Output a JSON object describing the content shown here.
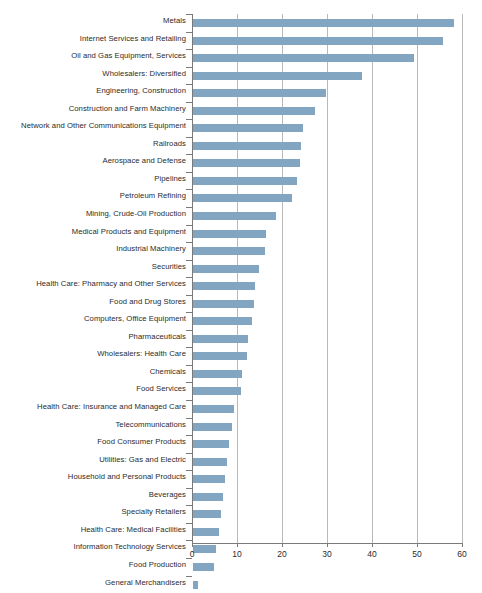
{
  "chart_data": {
    "type": "bar",
    "orientation": "horizontal",
    "title": "",
    "subtitle": "",
    "xlabel": "",
    "ylabel": "",
    "xlim": [
      0,
      60
    ],
    "xticks": [
      0,
      10,
      20,
      30,
      40,
      50,
      60
    ],
    "xtick_labels": [
      "0",
      "10",
      "20",
      "30",
      "40",
      "50",
      "60"
    ],
    "grid": "vertical",
    "legend": "none",
    "bar_color": "#82a6c1",
    "axis_color": "#7a7a7a",
    "gridline_color": "#b9b9b9",
    "text_color": "#2b2b2b",
    "categories": [
      "Metals",
      "Internet Services and Retailing",
      "Oil and Gas Equipment, Services",
      "Wholesalers: Diversified",
      "Engineering, Construction",
      "Construction and Farm Machinery",
      "Network and Other Communications Equipment",
      "Railroads",
      "Aerospace and Defense",
      "Pipelines",
      "Petroleum Refining",
      "Mining, Crude-Oil Production",
      "Medical Products and Equipment",
      "Industrial Machinery",
      "Securities",
      "Health Care: Pharmacy and Other Services",
      "Food and Drug Stores",
      "Computers, Office Equipment",
      "Pharmaceuticals",
      "Wholesalers: Health Care",
      "Chemicals",
      "Food Services",
      "Health Care: Insurance and Managed Care",
      "Telecommunications",
      "Food Consumer Products",
      "Utilities: Gas and Electric",
      "Household and Personal Products",
      "Beverages",
      "Specialty Retailers",
      "Health Care: Medical Facilities",
      "Information Technology Services",
      "Food Production",
      "General Merchandisers"
    ],
    "values": [
      58.0,
      55.5,
      49.0,
      37.5,
      29.5,
      27.0,
      24.5,
      24.0,
      23.8,
      23.0,
      22.0,
      18.5,
      16.2,
      16.0,
      14.7,
      13.8,
      13.5,
      13.0,
      12.3,
      12.0,
      10.8,
      10.7,
      9.0,
      8.7,
      8.0,
      7.5,
      7.0,
      6.7,
      6.2,
      5.8,
      5.0,
      4.7,
      1.2
    ]
  }
}
